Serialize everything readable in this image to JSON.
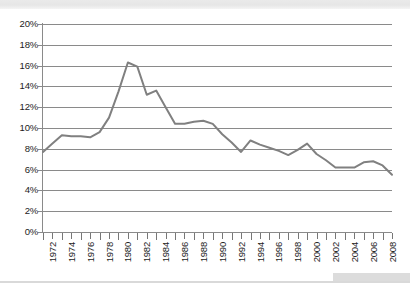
{
  "page": {
    "background_color": "#ffffff",
    "artifacts": {
      "top_band_color": "#e4e4e4",
      "bottom_rule_color": "#d9d9d9",
      "corner_box_color": "#dcdcdc"
    }
  },
  "chart_data": {
    "type": "line",
    "title": "",
    "xlabel": "",
    "ylabel": "",
    "grid": true,
    "legend": "none",
    "line_color": "#808080",
    "axis_color": "#8a8a8a",
    "xlim": [
      1972,
      2009
    ],
    "ylim": [
      0,
      20
    ],
    "ytick_step": 2,
    "xtick_step": 1,
    "xlabel_step": 2,
    "y_tick_labels": [
      "0%",
      "2%",
      "4%",
      "6%",
      "8%",
      "10%",
      "12%",
      "14%",
      "16%",
      "18%",
      "20%"
    ],
    "y_tick_values": [
      0,
      2,
      4,
      6,
      8,
      10,
      12,
      14,
      16,
      18,
      20
    ],
    "x_tick_labels": [
      "1972",
      "1974",
      "1976",
      "1978",
      "1980",
      "1982",
      "1984",
      "1986",
      "1988",
      "1990",
      "1992",
      "1994",
      "1996",
      "1998",
      "2000",
      "2002",
      "2004",
      "2006",
      "2008"
    ],
    "x": [
      1972,
      1973,
      1974,
      1975,
      1976,
      1977,
      1978,
      1979,
      1980,
      1981,
      1982,
      1983,
      1984,
      1985,
      1986,
      1987,
      1988,
      1989,
      1990,
      1991,
      1992,
      1993,
      1994,
      1995,
      1996,
      1997,
      1998,
      1999,
      2000,
      2001,
      2002,
      2003,
      2004,
      2005,
      2006,
      2007,
      2008,
      2009
    ],
    "values": [
      7.7,
      8.5,
      9.3,
      9.2,
      9.2,
      9.1,
      9.6,
      11.0,
      13.5,
      16.3,
      15.9,
      13.2,
      13.6,
      12.0,
      10.4,
      10.4,
      10.6,
      10.7,
      10.4,
      9.4,
      8.6,
      7.7,
      8.8,
      8.4,
      8.1,
      7.8,
      7.4,
      7.9,
      8.5,
      7.5,
      6.9,
      6.2,
      6.2,
      6.2,
      6.7,
      6.8,
      6.4,
      5.5
    ],
    "series": [
      {
        "name": "",
        "values": [
          7.7,
          8.5,
          9.3,
          9.2,
          9.2,
          9.1,
          9.6,
          11.0,
          13.5,
          16.3,
          15.9,
          13.2,
          13.6,
          12.0,
          10.4,
          10.4,
          10.6,
          10.7,
          10.4,
          9.4,
          8.6,
          7.7,
          8.8,
          8.4,
          8.1,
          7.8,
          7.4,
          7.9,
          8.5,
          7.5,
          6.9,
          6.2,
          6.2,
          6.2,
          6.7,
          6.8,
          6.4,
          5.5
        ]
      }
    ],
    "annotations": {
      "peak_year": 1981,
      "peak_value": 16.3,
      "min_year": 2009,
      "min_value": 5.5,
      "start_value": 7.7
    }
  }
}
